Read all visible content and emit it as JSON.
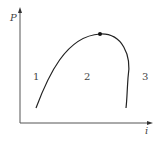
{
  "diagram": {
    "type": "P-i phase diagram",
    "axes": {
      "y_label": "P",
      "x_label": "i"
    },
    "regions": [
      {
        "id": "1",
        "label": "1"
      },
      {
        "id": "2",
        "label": "2"
      },
      {
        "id": "3",
        "label": "3"
      }
    ],
    "critical_point": {
      "marker": "dot"
    },
    "colors": {
      "curve": "#222222",
      "axis": "#555555",
      "text": "#444444"
    }
  }
}
